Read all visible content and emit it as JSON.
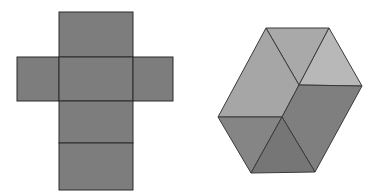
{
  "figures": {
    "net": {
      "label": "cube-net",
      "faces": [
        {
          "name": "top",
          "x": 59,
          "y": 12,
          "w": 74,
          "h": 45
        },
        {
          "name": "left",
          "x": 17,
          "y": 57,
          "w": 42,
          "h": 44
        },
        {
          "name": "center",
          "x": 59,
          "y": 57,
          "w": 74,
          "h": 44
        },
        {
          "name": "right",
          "x": 133,
          "y": 57,
          "w": 40,
          "h": 44
        },
        {
          "name": "lower",
          "x": 59,
          "y": 101,
          "w": 74,
          "h": 42
        },
        {
          "name": "bottom",
          "x": 59,
          "y": 143,
          "w": 74,
          "h": 47
        }
      ],
      "fill": "#7d7d7d",
      "stroke": "#2a2a2a"
    },
    "solid": {
      "label": "hexagonal-solid",
      "faces": [
        {
          "name": "top-triangle",
          "points": "266,28 329,28 299,85",
          "fill": "#a9a9a9"
        },
        {
          "name": "top-right-triangle",
          "points": "329,28 362,86 299,85",
          "fill": "#b8b8b8"
        },
        {
          "name": "left-quad",
          "points": "266,28 299,85 282,117 218,117",
          "fill": "#a6a6a6"
        },
        {
          "name": "right-quad",
          "points": "299,85 362,86 315,172 282,117",
          "fill": "#7f7f7f"
        },
        {
          "name": "bottom-left-triangle",
          "points": "218,117 282,117 251,173",
          "fill": "#858585"
        },
        {
          "name": "bottom-triangle",
          "points": "282,117 315,172 251,173",
          "fill": "#767676"
        }
      ],
      "stroke": "#3a3a3a"
    }
  }
}
